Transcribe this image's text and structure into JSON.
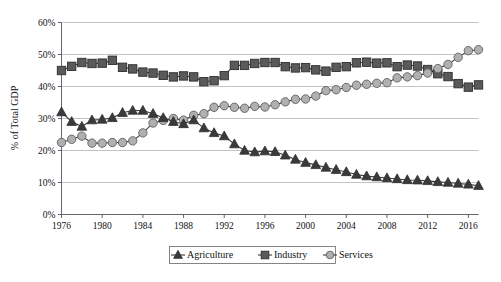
{
  "chart_data": {
    "type": "line",
    "title": "",
    "subtitle": "",
    "xlabel": "",
    "ylabel": "% of Total GDP",
    "xlim": [
      1976,
      2017
    ],
    "ylim": [
      0,
      60
    ],
    "ytick_labels": [
      "0%",
      "10%",
      "20%",
      "30%",
      "40%",
      "50%",
      "60%"
    ],
    "ytick_values": [
      0,
      10,
      20,
      30,
      40,
      50,
      60
    ],
    "xtick_labels": [
      "1976",
      "1980",
      "1984",
      "1988",
      "1992",
      "1996",
      "2000",
      "2004",
      "2008",
      "2012",
      "2016"
    ],
    "xtick_values": [
      1976,
      1980,
      1984,
      1988,
      1992,
      1996,
      2000,
      2004,
      2008,
      2012,
      2016
    ],
    "grid": "horizontal",
    "legend_position": "bottom-center",
    "x": [
      1976,
      1977,
      1978,
      1979,
      1980,
      1981,
      1982,
      1983,
      1984,
      1985,
      1986,
      1987,
      1988,
      1989,
      1990,
      1991,
      1992,
      1993,
      1994,
      1995,
      1996,
      1997,
      1998,
      1999,
      2000,
      2001,
      2002,
      2003,
      2004,
      2005,
      2006,
      2007,
      2008,
      2009,
      2010,
      2011,
      2012,
      2013,
      2014,
      2015,
      2016,
      2017
    ],
    "series": [
      {
        "name": "Agriculture",
        "marker": "triangle",
        "color": "#3a3a3a",
        "values": [
          32.0,
          29.0,
          27.5,
          29.5,
          29.7,
          30.2,
          31.8,
          32.5,
          32.5,
          31.5,
          30.2,
          29.0,
          28.3,
          29.5,
          27.0,
          25.5,
          24.5,
          22.0,
          20.0,
          19.5,
          19.8,
          19.6,
          18.5,
          17.2,
          16.2,
          15.5,
          14.7,
          14.0,
          13.3,
          12.5,
          12.0,
          11.7,
          11.4,
          11.1,
          10.8,
          10.7,
          10.5,
          10.2,
          10.0,
          9.7,
          9.4,
          9.0
        ]
      },
      {
        "name": "Industry",
        "marker": "square",
        "color": "#5a5a5a",
        "values": [
          45.0,
          46.3,
          47.5,
          47.2,
          47.3,
          48.2,
          46.0,
          45.5,
          44.5,
          44.2,
          43.5,
          43.0,
          43.3,
          43.0,
          41.5,
          41.8,
          43.4,
          46.6,
          46.6,
          47.2,
          47.5,
          47.5,
          46.2,
          45.8,
          45.9,
          45.2,
          44.8,
          46.0,
          46.2,
          47.4,
          47.6,
          47.3,
          47.4,
          46.2,
          46.7,
          46.4,
          45.3,
          44.0,
          43.1,
          40.9,
          39.8,
          40.5
        ]
      },
      {
        "name": "Services",
        "marker": "circle",
        "color": "#b0b0b0",
        "values": [
          22.5,
          23.5,
          24.5,
          22.3,
          22.3,
          22.5,
          22.5,
          23.0,
          25.5,
          28.6,
          29.4,
          30.0,
          29.5,
          31.0,
          31.5,
          33.5,
          34.0,
          33.5,
          33.2,
          33.8,
          33.6,
          34.3,
          35.2,
          36.0,
          36.1,
          37.0,
          38.7,
          39.0,
          39.7,
          40.4,
          40.7,
          41.0,
          41.2,
          42.7,
          43.0,
          43.4,
          44.2,
          45.6,
          46.9,
          49.1,
          51.2,
          51.5
        ]
      }
    ]
  },
  "legend": {
    "items": [
      {
        "label": "Agriculture",
        "marker": "triangle-marker"
      },
      {
        "label": "Industry",
        "marker": "square-marker"
      },
      {
        "label": "Services",
        "marker": "circle-marker"
      }
    ]
  }
}
